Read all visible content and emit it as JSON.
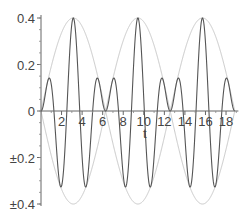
{
  "chart_data": {
    "type": "line",
    "title": "",
    "xlabel": "t",
    "ylabel": "",
    "xlim": [
      0,
      19.2
    ],
    "ylim": [
      -0.4,
      0.4
    ],
    "x_ticks": [
      2,
      4,
      6,
      8,
      10,
      12,
      14,
      16,
      18
    ],
    "x_tick_labels": [
      "2",
      "4",
      "6",
      "8",
      "10",
      "12",
      "14",
      "16",
      "18"
    ],
    "y_ticks": [
      0.4,
      0.2,
      0,
      -0.2,
      -0.4
    ],
    "y_tick_labels": [
      "0.4",
      "0.2",
      "0",
      "±0.2",
      "±0.4"
    ],
    "grid": false,
    "legend": null,
    "series": [
      {
        "name": "envelope upper",
        "color": "#c8c8c8",
        "formula": "0.4*|sin(t/2)|",
        "x": [
          0,
          3.14,
          6.28,
          9.42,
          12.57,
          15.71,
          18.85
        ],
        "values": [
          0,
          0.4,
          0,
          0.4,
          0,
          0.4,
          0
        ]
      },
      {
        "name": "envelope lower",
        "color": "#c8c8c8",
        "formula": "-0.4*|sin(t/2)|",
        "x": [
          0,
          3.14,
          6.28,
          9.42,
          12.57,
          15.71,
          18.85
        ],
        "values": [
          0,
          -0.4,
          0,
          -0.4,
          0,
          -0.4,
          0
        ]
      },
      {
        "name": "signal",
        "color": "#555555",
        "formula": "0.4*sin(t/2)*sin(5t/2)",
        "x": [
          0,
          0.8,
          1.9,
          3.14,
          4.4,
          5.5,
          6.28,
          7.05,
          8.2,
          9.42,
          10.7,
          11.8,
          12.57,
          13.3,
          14.5,
          15.71,
          17.0,
          18.1,
          18.85
        ],
        "values": [
          0,
          0.14,
          -0.33,
          0.4,
          -0.33,
          0.14,
          0,
          0.14,
          -0.33,
          0.4,
          -0.33,
          0.14,
          0,
          0.14,
          -0.33,
          0.4,
          -0.33,
          0.14,
          0
        ]
      }
    ]
  }
}
